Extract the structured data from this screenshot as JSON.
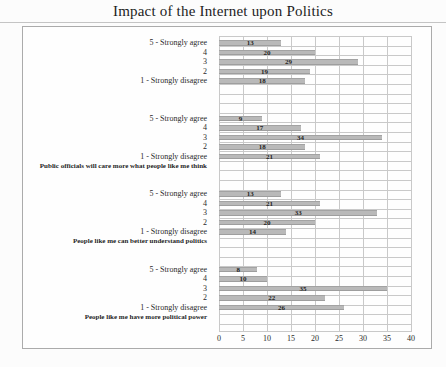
{
  "title": "Impact of the Internet upon Politics",
  "chart_data": {
    "type": "bar",
    "orientation": "horizontal",
    "title": "Impact of the Internet upon Politics",
    "categories": [
      "5 - Strongly agree",
      "4",
      "3",
      "2",
      "1 - Strongly disagree"
    ],
    "groups": [
      {
        "label": "",
        "values": [
          13,
          20,
          29,
          19,
          18
        ]
      },
      {
        "label": "Public officials will care more what people like me think",
        "values": [
          9,
          17,
          34,
          18,
          21
        ]
      },
      {
        "label": "People like me can better understand politics",
        "values": [
          13,
          21,
          33,
          20,
          14
        ]
      },
      {
        "label": "People like me have more political power",
        "values": [
          8,
          10,
          35,
          22,
          26
        ]
      }
    ],
    "xlim": [
      0,
      40
    ],
    "xticks": [
      "0",
      "5",
      "10",
      "15",
      "20",
      "25",
      "30",
      "35",
      "40"
    ],
    "grid": true,
    "legend": "none",
    "colors": {
      "bar_fill": "#b9b9b9",
      "bar_edge": "#a3a3a3",
      "gridline": "#c9c9c9",
      "chart_border": "#ababab",
      "text": "#2a2a2a"
    }
  }
}
